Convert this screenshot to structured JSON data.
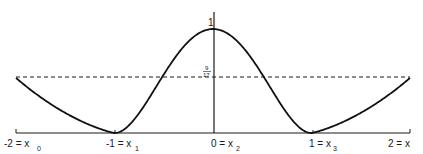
{
  "chart_data": {
    "type": "line",
    "title": "",
    "xlabel": "x",
    "ylabel": "",
    "xlim": [
      -2,
      2
    ],
    "ylim": [
      0,
      1
    ],
    "grid": false,
    "x_ticks": [
      {
        "value": -2,
        "label": "-2 = x",
        "sub": "0"
      },
      {
        "value": -1,
        "label": "-1 = x",
        "sub": "1"
      },
      {
        "value": 0,
        "label": "0 = x",
        "sub": "2"
      },
      {
        "value": 1,
        "label": "1 = x",
        "sub": "3"
      },
      {
        "value": 2,
        "label": "2 = x",
        "sub": ""
      }
    ],
    "y_annotations": [
      {
        "value": 1,
        "label": "1"
      },
      {
        "value": 0.5294,
        "label": "9/17",
        "num": "9",
        "den": "17",
        "style": "dashed-horizontal-line"
      }
    ],
    "series": [
      {
        "name": "curve",
        "x": [
          -2,
          -1.75,
          -1.5,
          -1.25,
          -1,
          -0.75,
          -0.5,
          -0.25,
          0,
          0.25,
          0.5,
          0.75,
          1,
          1.25,
          1.5,
          1.75,
          2
        ],
        "y": [
          0.529,
          0.37,
          0.22,
          0.09,
          0,
          0.19,
          0.56,
          0.88,
          1,
          0.88,
          0.56,
          0.19,
          0,
          0.09,
          0.22,
          0.37,
          0.529
        ]
      }
    ]
  }
}
